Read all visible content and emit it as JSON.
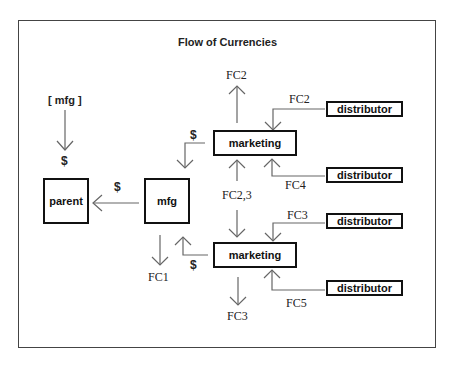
{
  "diagram": {
    "title": "Flow of Currencies",
    "nodes": {
      "parent": "parent",
      "mfg": "mfg",
      "marketing_top": "marketing",
      "marketing_bottom": "marketing",
      "distributor_1": "distributor",
      "distributor_2": "distributor",
      "distributor_3": "distributor",
      "distributor_4": "distributor"
    },
    "labels": {
      "mfg_source": "[ mfg ]",
      "dollar_to_parent_top": "$",
      "dollar_mfg_to_parent": "$",
      "dollar_marketing_to_mfg": "$",
      "dollar_bottom_marketing_to_mfg": "$",
      "fc2_out": "FC2",
      "fc2_in": "FC2",
      "fc4": "FC4",
      "fc23": "FC2,3",
      "fc3": "FC3",
      "fc5": "FC5",
      "fc1": "FC1",
      "fc3_out": "FC3"
    }
  }
}
